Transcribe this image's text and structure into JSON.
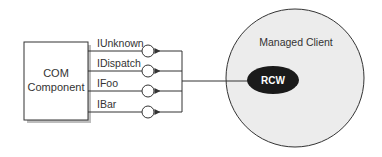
{
  "diagram": {
    "component": {
      "line1": "COM",
      "line2": "Component"
    },
    "interfaces": [
      {
        "label": "IUnknown"
      },
      {
        "label": "IDispatch"
      },
      {
        "label": "IFoo"
      },
      {
        "label": "IBar"
      }
    ],
    "client": {
      "label": "Managed Client"
    },
    "wrapper": {
      "label": "RCW"
    }
  },
  "colors": {
    "stroke": "#333333",
    "client_fill": "#ececec",
    "wrapper_fill": "#1a1a1a",
    "shadow": "#bdbdbd"
  }
}
